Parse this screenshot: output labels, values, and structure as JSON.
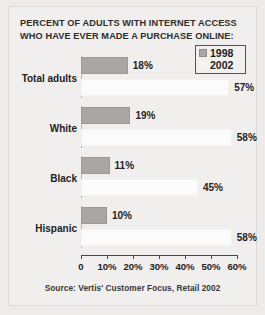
{
  "chart_data": {
    "type": "bar",
    "orientation": "horizontal",
    "title": "PERCENT OF ADULTS WITH INTERNET ACCESS WHO HAVE EVER MADE A PURCHASE ONLINE:",
    "title_lines": [
      "PERCENT OF ADULTS WITH INTERNET ACCESS",
      "WHO HAVE EVER MADE A PURCHASE ONLINE:"
    ],
    "categories": [
      "Total adults",
      "White",
      "Black",
      "Hispanic"
    ],
    "series": [
      {
        "name": "1998",
        "values": [
          18,
          19,
          11,
          10
        ],
        "value_labels": [
          "18%",
          "19%",
          "11%",
          "10%"
        ],
        "color": "#a9a6a3"
      },
      {
        "name": "2002",
        "values": [
          57,
          58,
          45,
          58
        ],
        "value_labels": [
          "57%",
          "58%",
          "45%",
          "58%"
        ],
        "color": "#fcfbfb"
      }
    ],
    "xlabel": "",
    "ylabel": "",
    "xlim": [
      0,
      60
    ],
    "xticks": [
      0,
      10,
      20,
      30,
      40,
      50,
      60
    ],
    "xtick_labels": [
      "0",
      "10%",
      "20%",
      "30%",
      "40%",
      "50%",
      "60%"
    ],
    "grid": false,
    "legend_position": "top-right",
    "legend_entries": [
      "1998",
      "2002"
    ],
    "source": "Source: Vertis' Customer Focus, Retail 2002"
  },
  "colors": {
    "background": "#eeecea",
    "panel": "#f1efed",
    "bar_1998": "#a9a6a3",
    "bar_2002": "#fcfbfb",
    "text": "#242222",
    "axis": "#4a4846"
  }
}
